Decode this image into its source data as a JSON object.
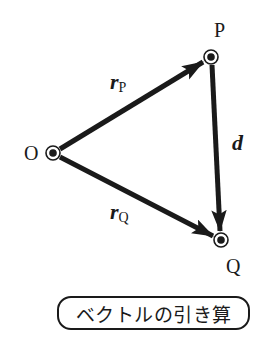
{
  "diagram": {
    "points": {
      "O": {
        "label": "O",
        "x": 53,
        "y": 153
      },
      "P": {
        "label": "P",
        "x": 211,
        "y": 57
      },
      "Q": {
        "label": "Q",
        "x": 221,
        "y": 240
      }
    },
    "vectors": [
      {
        "name": "r_P",
        "symbol": "r",
        "subscript": "P",
        "from": "O",
        "to": "P"
      },
      {
        "name": "r_Q",
        "symbol": "r",
        "subscript": "Q",
        "from": "O",
        "to": "Q"
      },
      {
        "name": "d",
        "symbol": "d",
        "subscript": "",
        "from": "P",
        "to": "Q"
      }
    ],
    "colors": {
      "stroke": "#1a1a1a",
      "background": "#ffffff"
    },
    "caption": "ベクトルの引き算"
  }
}
